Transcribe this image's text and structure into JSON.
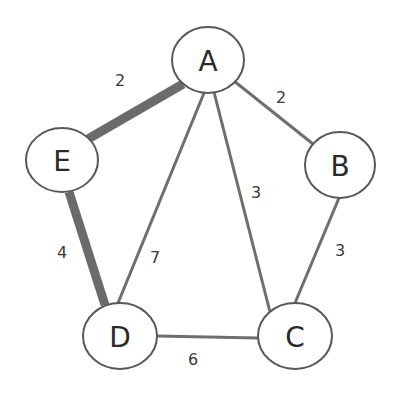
{
  "diagram": {
    "type": "weighted-undirected-graph",
    "nodes": [
      {
        "id": "A",
        "label": "A",
        "cx": 208,
        "cy": 60,
        "rx": 36,
        "ry": 33
      },
      {
        "id": "B",
        "label": "B",
        "cx": 340,
        "cy": 165,
        "rx": 35,
        "ry": 33
      },
      {
        "id": "C",
        "label": "C",
        "cx": 295,
        "cy": 336,
        "rx": 37,
        "ry": 33
      },
      {
        "id": "D",
        "label": "D",
        "cx": 120,
        "cy": 336,
        "rx": 37,
        "ry": 33
      },
      {
        "id": "E",
        "label": "E",
        "cx": 62,
        "cy": 160,
        "rx": 36,
        "ry": 32
      }
    ],
    "edges": [
      {
        "from": "A",
        "to": "E",
        "weight": "2",
        "highlighted": true,
        "label_x": 120,
        "label_y": 80
      },
      {
        "from": "A",
        "to": "B",
        "weight": "2",
        "highlighted": false,
        "label_x": 281,
        "label_y": 97
      },
      {
        "from": "A",
        "to": "C",
        "weight": "3",
        "highlighted": false,
        "label_x": 256,
        "label_y": 192
      },
      {
        "from": "A",
        "to": "D",
        "weight": "7",
        "highlighted": false,
        "label_x": 155,
        "label_y": 257
      },
      {
        "from": "E",
        "to": "D",
        "weight": "4",
        "highlighted": true,
        "label_x": 62,
        "label_y": 252
      },
      {
        "from": "B",
        "to": "C",
        "weight": "3",
        "highlighted": false,
        "label_x": 340,
        "label_y": 250
      },
      {
        "from": "D",
        "to": "C",
        "weight": "6",
        "highlighted": false,
        "label_x": 193,
        "label_y": 359
      }
    ],
    "colors": {
      "edge": "#6e6e6e",
      "highlighted_edge": "#6b6b6b",
      "node_stroke": "#585858",
      "node_fill": "#ffffff",
      "text": "#2a2a2a"
    }
  }
}
